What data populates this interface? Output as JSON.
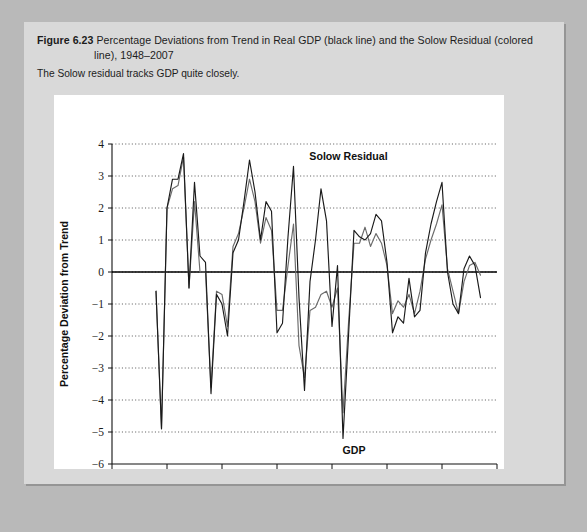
{
  "figure": {
    "number": "Figure 6.23",
    "caption_line1": "Percentage Deviations from Trend in Real GDP (black line) and the Solow Residual (colored",
    "caption_line2": "line), 1948–2007",
    "subtitle": "The Solow residual tracks GDP quite closely."
  },
  "chart_data": {
    "type": "line",
    "title": "Percentage Deviations from Trend in Real GDP (black line) and the Solow Residual (colored line), 1948–2007",
    "xlabel": "Year",
    "ylabel": "Percentage Deviation from Trend",
    "xlim": [
      1940,
      2010
    ],
    "ylim": [
      -6,
      4
    ],
    "xticks": [
      1940,
      1950,
      1960,
      1970,
      1980,
      1990,
      2000,
      2010
    ],
    "yticks": [
      -6,
      -5,
      -4,
      -3,
      -2,
      -1,
      0,
      1,
      2,
      3,
      4
    ],
    "xtick_labels": [
      "1940",
      "1950",
      "1960",
      "1970",
      "1980",
      "1990",
      "2000",
      "2010"
    ],
    "ytick_labels": [
      "−6",
      "−5",
      "−4",
      "−3",
      "−2",
      "−1",
      "0",
      "1",
      "2",
      "3",
      "4"
    ],
    "grid": true,
    "grid_axis": "y",
    "zero_line": true,
    "legend": "inline-annotations",
    "annotations": [
      {
        "text": "Solow Residual",
        "x": 1983,
        "y": 3.5,
        "anchor": "middle"
      },
      {
        "text": "GDP",
        "x": 1984,
        "y": -5.7,
        "anchor": "middle"
      }
    ],
    "x": [
      1948,
      1949,
      1950,
      1951,
      1952,
      1953,
      1954,
      1955,
      1956,
      1957,
      1958,
      1959,
      1960,
      1961,
      1962,
      1963,
      1964,
      1965,
      1966,
      1967,
      1968,
      1969,
      1970,
      1971,
      1972,
      1973,
      1974,
      1975,
      1976,
      1977,
      1978,
      1979,
      1980,
      1981,
      1982,
      1983,
      1984,
      1985,
      1986,
      1987,
      1988,
      1989,
      1990,
      1991,
      1992,
      1993,
      1994,
      1995,
      1996,
      1997,
      1998,
      1999,
      2000,
      2001,
      2002,
      2003,
      2004,
      2005,
      2006,
      2007
    ],
    "series": [
      {
        "name": "GDP",
        "color": "#1a1a1a",
        "style": "black line",
        "values": [
          -0.6,
          -4.9,
          2.0,
          2.9,
          2.9,
          3.7,
          -0.5,
          2.8,
          0.5,
          0.3,
          -3.8,
          -0.7,
          -1.0,
          -2.0,
          0.6,
          1.0,
          2.2,
          3.5,
          2.5,
          1.0,
          2.2,
          1.9,
          -1.9,
          -1.6,
          1.1,
          3.3,
          -0.8,
          -3.7,
          -0.3,
          1.0,
          2.6,
          1.6,
          -1.7,
          0.2,
          -5.2,
          -2.0,
          1.3,
          1.1,
          1.0,
          1.2,
          1.8,
          1.6,
          0.3,
          -1.9,
          -1.4,
          -1.6,
          -0.2,
          -1.4,
          -1.2,
          0.6,
          1.5,
          2.2,
          2.8,
          0.0,
          -1.0,
          -1.3,
          0.1,
          0.5,
          0.2,
          -0.8
        ]
      },
      {
        "name": "Solow Residual",
        "color": "#6b6b6b",
        "style": "colored line",
        "values": [
          -0.6,
          -4.9,
          2.0,
          2.6,
          2.7,
          3.6,
          -0.5,
          2.2,
          0.0,
          0.0,
          -3.6,
          -0.6,
          -0.7,
          -1.7,
          0.8,
          1.2,
          2.0,
          2.9,
          2.2,
          0.9,
          1.7,
          1.3,
          -1.2,
          -1.2,
          0.2,
          1.5,
          -2.3,
          -3.3,
          -1.2,
          -1.1,
          -0.7,
          -0.6,
          -1.1,
          -0.5,
          -4.4,
          -1.6,
          0.9,
          0.9,
          1.4,
          0.8,
          1.2,
          0.9,
          0.2,
          -1.3,
          -0.9,
          -1.1,
          -0.7,
          -1.3,
          -0.6,
          0.4,
          1.0,
          1.5,
          2.1,
          0.1,
          -0.6,
          -1.3,
          -0.3,
          0.2,
          0.3,
          -0.1
        ]
      }
    ]
  }
}
